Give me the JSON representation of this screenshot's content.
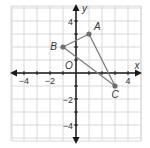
{
  "diagram": {
    "type": "coordinate-plane",
    "axes": {
      "x_label": "x",
      "y_label": "y",
      "origin_label": "O",
      "range": [
        -4.8,
        4.8
      ],
      "x_ticks": [
        {
          "value": -4,
          "label": "−4"
        },
        {
          "value": -2,
          "label": "−2"
        },
        {
          "value": 4,
          "label": "4"
        }
      ],
      "y_ticks": [
        {
          "value": 4,
          "label": "4"
        },
        {
          "value": -2,
          "label": "−2"
        },
        {
          "value": -4,
          "label": "−4"
        }
      ]
    },
    "points": [
      {
        "name": "A",
        "x": 1,
        "y": 3
      },
      {
        "name": "B",
        "x": -1,
        "y": 2
      },
      {
        "name": "C",
        "x": 3,
        "y": -1
      }
    ],
    "segments": [
      [
        "A",
        "B"
      ],
      [
        "B",
        "C"
      ],
      [
        "A",
        "C"
      ]
    ],
    "colors": {
      "grid": "#d8d8d8",
      "axis": "#1a1a1a",
      "triangle": "#7a7a7a",
      "point": "#6e6e6e",
      "label": "#555555"
    }
  }
}
